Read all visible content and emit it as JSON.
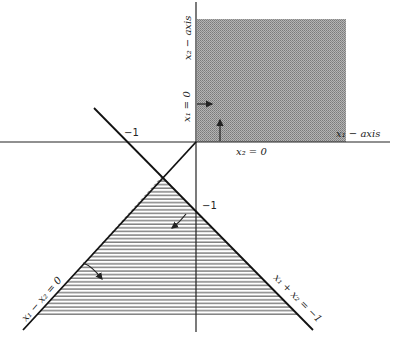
{
  "diagram": {
    "colors": {
      "ink": "#222222",
      "shade": "#9a9a9a",
      "hatch": "#444444",
      "background": "#ffffff"
    },
    "axes": {
      "x_label": "x₁ − axis",
      "y_label": "x₂ − axis",
      "x_tick_label": "−1",
      "y_tick_label": "−1"
    },
    "constraints": [
      {
        "id": "x1_nonneg",
        "label": "x₁ = 0"
      },
      {
        "id": "x2_nonneg",
        "label": "x₂ = 0"
      },
      {
        "id": "diff",
        "label": "x₁ − x₂ = 0"
      },
      {
        "id": "sum",
        "label": "x₁ + x₂ = −1"
      }
    ],
    "regions": [
      {
        "id": "first-quadrant",
        "style": "dotted shade",
        "description": "x1 ≥ 0, x2 ≥ 0"
      },
      {
        "id": "triangle",
        "style": "horizontal hatching",
        "description": "x1 + x2 ≤ −1, x1 − x2 ≥ 0 side"
      }
    ]
  }
}
